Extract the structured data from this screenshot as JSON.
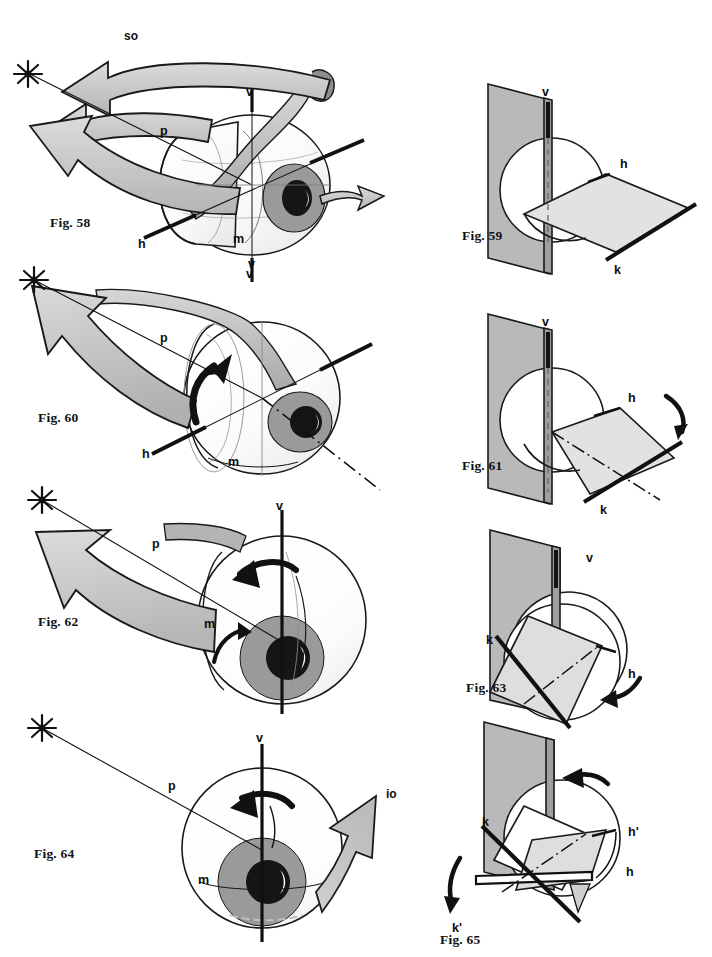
{
  "page": {
    "kind": "anatomical-figure-plate",
    "width": 712,
    "height": 957,
    "background": "#ffffff"
  },
  "palette": {
    "ink": "#111111",
    "outline": "#1a1a1a",
    "plane_vertical": "#b9b9b9",
    "plane_horizontal": "#e2e2e2",
    "plane_horizontal_shade": "#d2d2d2",
    "arrow_fill": "#c9c9c9",
    "arrow_fill_light": "#d8d8d8",
    "arrow_fill_dark": "#a8a8a8",
    "globe_fill": "#fdfdfd",
    "globe_shade": "#ececec",
    "iris": "#9a9a9a",
    "pupil": "#151515",
    "highlight": "#ffffff"
  },
  "figures": [
    {
      "id": "fig58",
      "caption": "Fig. 58",
      "column": "left",
      "type": "eye-globe-3d",
      "labels": [
        {
          "name": "muscle-so",
          "text": "so"
        },
        {
          "name": "axis-v-top",
          "text": "v"
        },
        {
          "name": "axis-v-bottom",
          "text": "v"
        },
        {
          "name": "axis-p",
          "text": "p"
        },
        {
          "name": "axis-h",
          "text": "h"
        },
        {
          "name": "axis-m",
          "text": "m"
        }
      ]
    },
    {
      "id": "fig59",
      "caption": "Fig. 59",
      "column": "right",
      "type": "plane-pair-3d",
      "labels": [
        {
          "name": "axis-v",
          "text": "v"
        },
        {
          "name": "axis-h",
          "text": "h"
        },
        {
          "name": "axis-k",
          "text": "k"
        }
      ]
    },
    {
      "id": "fig60",
      "caption": "Fig. 60",
      "column": "left",
      "type": "eye-globe-3d",
      "labels": [
        {
          "name": "axis-p",
          "text": "p"
        },
        {
          "name": "axis-h",
          "text": "h"
        },
        {
          "name": "axis-m",
          "text": "m"
        },
        {
          "name": "axis-v",
          "text": "v"
        }
      ]
    },
    {
      "id": "fig61",
      "caption": "Fig. 61",
      "column": "right",
      "type": "plane-pair-3d-tilted",
      "labels": [
        {
          "name": "axis-v",
          "text": "v"
        },
        {
          "name": "axis-h",
          "text": "h"
        },
        {
          "name": "axis-k",
          "text": "k"
        }
      ]
    },
    {
      "id": "fig62",
      "caption": "Fig. 62",
      "column": "left",
      "type": "eye-globe-3d",
      "labels": [
        {
          "name": "axis-v-top",
          "text": "v"
        },
        {
          "name": "axis-p",
          "text": "p"
        },
        {
          "name": "axis-m",
          "text": "m"
        }
      ]
    },
    {
      "id": "fig63",
      "caption": "Fig. 63",
      "column": "right",
      "type": "plane-pair-3d-rotated",
      "labels": [
        {
          "name": "axis-v",
          "text": "v"
        },
        {
          "name": "axis-k",
          "text": "k"
        },
        {
          "name": "axis-h",
          "text": "h"
        }
      ]
    },
    {
      "id": "fig64",
      "caption": "Fig. 64",
      "column": "left",
      "type": "eye-globe-front",
      "labels": [
        {
          "name": "axis-v",
          "text": "v"
        },
        {
          "name": "axis-p",
          "text": "p"
        },
        {
          "name": "axis-m",
          "text": "m"
        },
        {
          "name": "muscle-io",
          "text": "io"
        }
      ]
    },
    {
      "id": "fig65",
      "caption": "Fig. 65",
      "column": "right",
      "type": "plane-pair-3d-double-rotated",
      "labels": [
        {
          "name": "axis-k",
          "text": "k"
        },
        {
          "name": "axis-k-prime",
          "text": "k'"
        },
        {
          "name": "axis-h-prime",
          "text": "h'"
        },
        {
          "name": "axis-h",
          "text": "h"
        }
      ]
    }
  ],
  "legend_keys": {
    "so": "superior oblique",
    "io": "inferior oblique",
    "v": "vertical axis",
    "h": "horizontal axis",
    "p": "anteroposterior axis",
    "m": "meridian",
    "k": "axis k",
    "k_prime": "axis k'",
    "h_prime": "axis h'"
  }
}
